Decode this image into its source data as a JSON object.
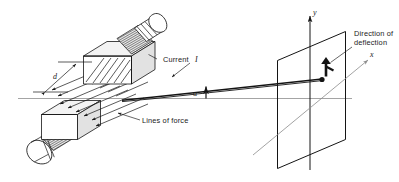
{
  "figure": {
    "background_color": "#ffffff",
    "line_color": "#141414",
    "axis_color": "#9a9a9a"
  },
  "labels": {
    "current": "Current",
    "current_symbol": "I",
    "lines_of_force": "Lines of force",
    "direction_of_deflection_line1": "Direction of",
    "direction_of_deflection_line2": "deflection",
    "gap_dimension": "d",
    "angle": "α",
    "axis_y": "y",
    "axis_x": "x"
  },
  "elements": {
    "upper_pole": "upper-magnet-pole",
    "lower_pole": "lower-magnet-pole",
    "upper_coil": "upper-cylindrical-coil",
    "lower_coil": "lower-cylindrical-coil",
    "screen": "detection-screen-plane",
    "beam": "particle-beam-ray",
    "spot": "beam-spot",
    "deflection_arrow": "deflection-direction-arrow",
    "baseline": "undeflected-axis-line"
  }
}
